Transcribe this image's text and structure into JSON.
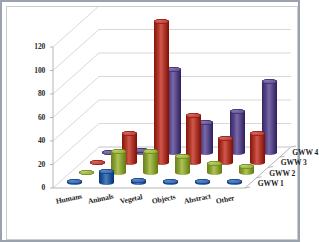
{
  "chart_data": {
    "type": "bar",
    "title": "",
    "subtitle": "",
    "xlabel": "",
    "ylabel": "",
    "zlabel": "",
    "ylim": [
      0,
      120
    ],
    "yticks": [
      0,
      20,
      40,
      60,
      80,
      100,
      120
    ],
    "grid": true,
    "legend_position": "right-depth-axis",
    "projection": "3d",
    "categories": [
      "Humans",
      "Animals",
      "Vegetal",
      "Objects",
      "Abstract",
      "Other"
    ],
    "series": [
      {
        "name": "GWW 1",
        "color": "#2E5FA3",
        "values": [
          1,
          10,
          2,
          1,
          1,
          1
        ]
      },
      {
        "name": "GWW 2",
        "color": "#8EA63A",
        "values": [
          0,
          18,
          18,
          14,
          8,
          5
        ]
      },
      {
        "name": "GWW 3",
        "color": "#B03A2E",
        "values": [
          0,
          25,
          120,
          40,
          20,
          25
        ]
      },
      {
        "name": "GWW 4",
        "color": "#5B4B8A",
        "values": [
          0,
          1,
          70,
          25,
          35,
          60
        ]
      }
    ],
    "axis_tick_labels": [
      "0",
      "20",
      "40",
      "60",
      "80",
      "100",
      "120"
    ],
    "depth_axis_labels": [
      "GWW 1",
      "GWW 2",
      "GWW 3",
      "GWW 4"
    ]
  },
  "colors": {
    "frame": "#9aa3ad",
    "inner_border": "#c9ced4",
    "background": "#ffffff",
    "grid": "#d8d8d8",
    "axis": "#b5b5b5",
    "text": "#1d1d1d"
  }
}
